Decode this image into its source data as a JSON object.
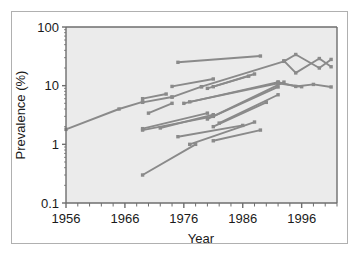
{
  "figure": {
    "background_color": "#ffffff",
    "plot_background_color": "#ebebeb",
    "frame_color": "#6e6e6e",
    "line_color": "#8a8a8a",
    "border_color": "#b0b0b0"
  },
  "chart_data": {
    "type": "line",
    "title": "",
    "xlabel": "Year",
    "ylabel": "Prevalence (%)",
    "xlim": [
      1956,
      2002
    ],
    "ylim": [
      0.1,
      100
    ],
    "yscale": "log",
    "xscale": "linear",
    "grid": false,
    "legend": "none",
    "xticks": [
      1956,
      1966,
      1976,
      1986,
      1996
    ],
    "xtick_labels": [
      "1956",
      "1966",
      "1976",
      "1986",
      "1996"
    ],
    "xminor_tick_step": 2,
    "yticks": [
      0.1,
      1,
      10,
      100
    ],
    "ytick_labels": [
      "0.1",
      "1",
      "10",
      "100"
    ],
    "marker": "square",
    "series": [
      {
        "name": "study-01",
        "x": [
          1956,
          1965,
          1969
        ],
        "y": [
          1.8,
          4.0,
          5.3
        ]
      },
      {
        "name": "study-02",
        "x": [
          1969,
          1973
        ],
        "y": [
          6.0,
          7.2
        ]
      },
      {
        "name": "study-03",
        "x": [
          1969,
          1974
        ],
        "y": [
          5.2,
          6.4
        ]
      },
      {
        "name": "study-04",
        "x": [
          1970,
          1974
        ],
        "y": [
          3.4,
          5.0
        ]
      },
      {
        "name": "study-05",
        "x": [
          1974,
          1981
        ],
        "y": [
          9.7,
          13.0
        ]
      },
      {
        "name": "study-06",
        "x": [
          1974,
          1979
        ],
        "y": [
          6.4,
          9.6
        ]
      },
      {
        "name": "study-07",
        "x": [
          1975,
          1989
        ],
        "y": [
          25.0,
          32.0
        ]
      },
      {
        "name": "study-08",
        "x": [
          1979,
          1993
        ],
        "y": [
          9.6,
          26.0
        ]
      },
      {
        "name": "study-09",
        "x": [
          1980,
          1987
        ],
        "y": [
          9.0,
          14.5
        ]
      },
      {
        "name": "study-10",
        "x": [
          1981,
          1988
        ],
        "y": [
          9.6,
          15.8
        ]
      },
      {
        "name": "study-11",
        "x": [
          1976,
          1992
        ],
        "y": [
          5.0,
          11.5
        ]
      },
      {
        "name": "study-12",
        "x": [
          1977,
          1992
        ],
        "y": [
          5.3,
          11.0
        ]
      },
      {
        "name": "study-13",
        "x": [
          1969,
          1980
        ],
        "y": [
          1.85,
          3.4
        ]
      },
      {
        "name": "study-14",
        "x": [
          1969,
          1981
        ],
        "y": [
          1.75,
          3.0
        ]
      },
      {
        "name": "study-15",
        "x": [
          1972,
          1981
        ],
        "y": [
          1.9,
          3.2
        ]
      },
      {
        "name": "study-16",
        "x": [
          1975,
          1986
        ],
        "y": [
          1.35,
          2.1
        ]
      },
      {
        "name": "study-17",
        "x": [
          1977,
          1988
        ],
        "y": [
          1.0,
          2.4
        ]
      },
      {
        "name": "study-18",
        "x": [
          1980,
          1993
        ],
        "y": [
          2.7,
          11.5
        ]
      },
      {
        "name": "study-19",
        "x": [
          1981,
          1992
        ],
        "y": [
          3.0,
          9.5
        ]
      },
      {
        "name": "study-20",
        "x": [
          1982,
          1992
        ],
        "y": [
          2.3,
          7.0
        ]
      },
      {
        "name": "study-21",
        "x": [
          1981,
          1990
        ],
        "y": [
          2.0,
          5.2
        ]
      },
      {
        "name": "study-22",
        "x": [
          1969,
          1978
        ],
        "y": [
          0.3,
          1.0
        ]
      },
      {
        "name": "study-23",
        "x": [
          1981,
          1989
        ],
        "y": [
          1.15,
          1.75
        ]
      },
      {
        "name": "study-24",
        "x": [
          1993,
          1995,
          1999,
          2001
        ],
        "y": [
          26.0,
          34.0,
          20.0,
          28.0
        ]
      },
      {
        "name": "study-25",
        "x": [
          1993,
          1995,
          1999,
          2001
        ],
        "y": [
          26.5,
          16.5,
          29.0,
          21.0
        ]
      },
      {
        "name": "study-26",
        "x": [
          1992,
          1995,
          1998,
          2001
        ],
        "y": [
          11.5,
          9.7,
          10.5,
          9.5
        ]
      },
      {
        "name": "study-27",
        "x": [
          1992,
          1996
        ],
        "y": [
          11.0,
          9.6
        ]
      }
    ]
  }
}
